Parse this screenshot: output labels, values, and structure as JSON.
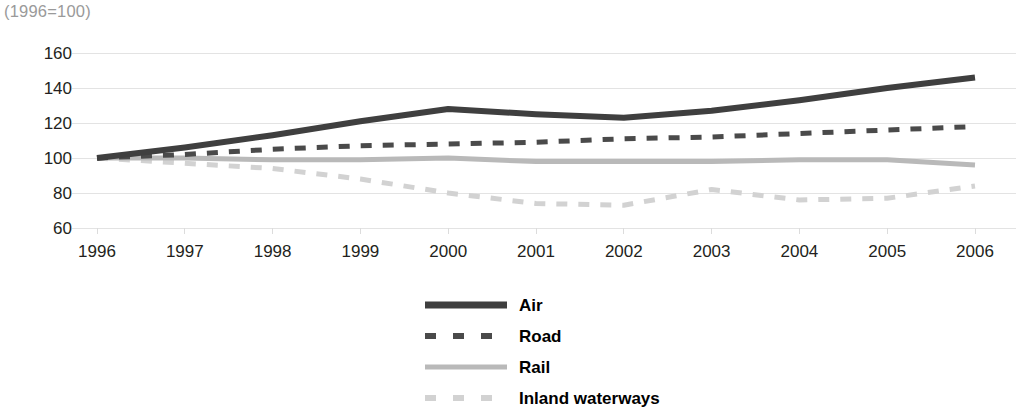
{
  "subtitle": "(1996=100)",
  "chart_data": {
    "type": "line",
    "title": "",
    "subtitle": "(1996=100)",
    "xlabel": "",
    "ylabel": "",
    "x": [
      1996,
      1997,
      1998,
      1999,
      2000,
      2001,
      2002,
      2003,
      2004,
      2005,
      2006
    ],
    "categories": [
      "1996",
      "1997",
      "1998",
      "1999",
      "2000",
      "2001",
      "2002",
      "2003",
      "2004",
      "2005",
      "2006"
    ],
    "xlim": [
      1996,
      2006
    ],
    "ylim": [
      60,
      160
    ],
    "yticks": [
      60,
      80,
      100,
      120,
      140,
      160
    ],
    "xticks": [
      "1996",
      "1997",
      "1998",
      "1999",
      "2000",
      "2001",
      "2002",
      "2003",
      "2004",
      "2005",
      "2006"
    ],
    "grid": true,
    "legend_position": "bottom-center",
    "series": [
      {
        "name": "Air",
        "style": "solid-thick",
        "color": "#3f3f3f",
        "values": [
          100,
          106,
          113,
          121,
          128,
          125,
          123,
          127,
          133,
          140,
          146
        ]
      },
      {
        "name": "Road",
        "style": "dashed",
        "color": "#4a4a4a",
        "values": [
          100,
          102,
          105,
          107,
          108,
          109,
          111,
          112,
          114,
          116,
          118
        ]
      },
      {
        "name": "Rail",
        "style": "solid",
        "color": "#b9b9b9",
        "values": [
          100,
          100,
          99,
          99,
          100,
          98,
          98,
          98,
          99,
          99,
          96
        ]
      },
      {
        "name": "Inland waterways",
        "style": "dashed",
        "color": "#d2d2d2",
        "values": [
          100,
          97,
          94,
          88,
          80,
          74,
          73,
          82,
          76,
          77,
          84
        ]
      }
    ]
  },
  "y_axis": {
    "ticks": [
      "160",
      "140",
      "120",
      "100",
      "80",
      "60"
    ]
  },
  "x_axis": {
    "ticks": [
      "1996",
      "1997",
      "1998",
      "1999",
      "2000",
      "2001",
      "2002",
      "2003",
      "2004",
      "2005",
      "2006"
    ]
  },
  "legend": {
    "items": [
      {
        "label": "Air",
        "color": "#3f3f3f",
        "style": "solid-thick"
      },
      {
        "label": "Road",
        "color": "#4a4a4a",
        "style": "dashed"
      },
      {
        "label": "Rail",
        "color": "#b9b9b9",
        "style": "solid"
      },
      {
        "label": "Inland waterways",
        "color": "#d2d2d2",
        "style": "dashed"
      }
    ]
  },
  "colors": {
    "grid": "#e3e3e3",
    "text": "#231f20",
    "subtitle": "#9a9a9a"
  }
}
